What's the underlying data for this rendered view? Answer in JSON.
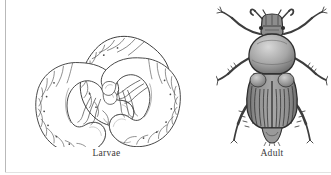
{
  "figure": {
    "background_color": "#ffffff",
    "ink_color": "#2e2e2e",
    "rule_color": "#b9b9b9",
    "panels": [
      {
        "id": "larvae",
        "caption": "Larvae",
        "subject": "scarab-beetle-grubs",
        "count": 3,
        "arrangement": "triangular-pinwheel",
        "description": "Three C-shaped white grubs with segmented bodies, thoracic legs and swollen abdominal tips"
      },
      {
        "id": "adult",
        "caption": "Adult",
        "subject": "scarab-beetle",
        "count": 1,
        "view": "dorsal",
        "description": "Dorsal view of an adult scarab beetle with clubbed antennae, stippled pronotum, striated elytra and six spined legs"
      }
    ]
  },
  "captions": {
    "larvae": "Larvae",
    "adult": "Adult"
  }
}
